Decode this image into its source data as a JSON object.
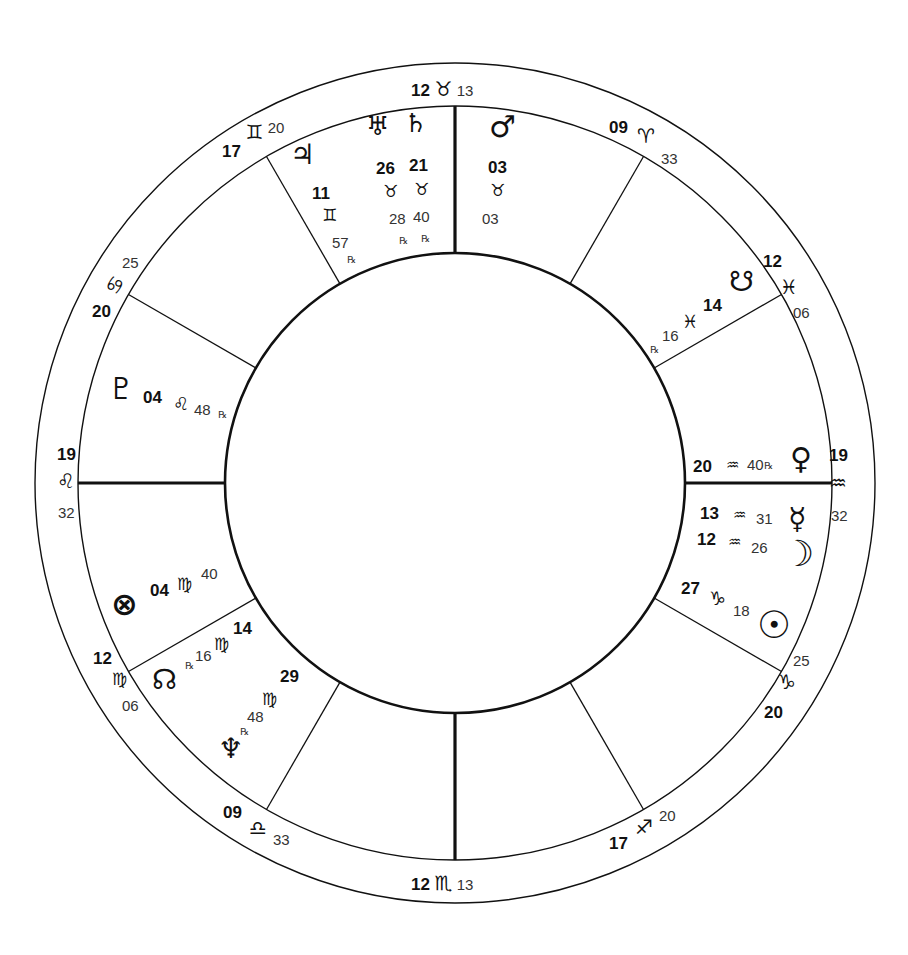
{
  "chart_geometry": {
    "center_x": 455,
    "center_y": 483,
    "outer_radius": 420,
    "zodiac_inner_radius": 377,
    "inner_radius": 230,
    "line_color": "#111111"
  },
  "house_cusps": [
    {
      "house": 1,
      "sign": "Leo",
      "glyph": "♌",
      "degree": "19",
      "minute": "32"
    },
    {
      "house": 2,
      "sign": "Virgo",
      "glyph": "♍",
      "degree": "12",
      "minute": "06"
    },
    {
      "house": 3,
      "sign": "Libra",
      "glyph": "♎",
      "degree": "09",
      "minute": "33"
    },
    {
      "house": 4,
      "sign": "Scorpio",
      "glyph": "♏",
      "degree": "12",
      "minute": "13"
    },
    {
      "house": 5,
      "sign": "Sagittarius",
      "glyph": "♐",
      "degree": "17",
      "minute": "20"
    },
    {
      "house": 6,
      "sign": "Capricorn",
      "glyph": "♑",
      "degree": "20",
      "minute": "25"
    },
    {
      "house": 7,
      "sign": "Aquarius",
      "glyph": "♒",
      "degree": "19",
      "minute": "32"
    },
    {
      "house": 8,
      "sign": "Pisces",
      "glyph": "♓",
      "degree": "12",
      "minute": "06"
    },
    {
      "house": 9,
      "sign": "Aries",
      "glyph": "♈",
      "degree": "09",
      "minute": "33"
    },
    {
      "house": 10,
      "sign": "Taurus",
      "glyph": "♉",
      "degree": "12",
      "minute": "13"
    },
    {
      "house": 11,
      "sign": "Gemini",
      "glyph": "♊",
      "degree": "17",
      "minute": "20"
    },
    {
      "house": 12,
      "sign": "Cancer",
      "glyph": "♋",
      "degree": "20",
      "minute": "25"
    }
  ],
  "planets": {
    "uranus": {
      "glyph": "♅",
      "degree": "26",
      "sign_glyph": "♉",
      "minute": "28",
      "retro": "℞"
    },
    "saturn": {
      "glyph": "♄",
      "degree": "21",
      "sign_glyph": "♉",
      "minute": "40",
      "retro": "℞"
    },
    "jupiter": {
      "glyph": "♃",
      "degree": "11",
      "sign_glyph": "♊",
      "minute": "57",
      "retro": "℞"
    },
    "mars": {
      "glyph": "♂",
      "degree": "03",
      "sign_glyph": "♉",
      "minute": "03"
    },
    "south_node": {
      "glyph": "☋",
      "degree": "14",
      "sign_glyph": "♓",
      "minute": "16",
      "retro": "℞"
    },
    "pluto": {
      "glyph": "♇",
      "degree": "04",
      "sign_glyph": "♌",
      "minute": "48",
      "retro": "℞"
    },
    "venus": {
      "glyph": "♀",
      "degree": "20",
      "sign_glyph": "♒",
      "minute": "40",
      "retro": "℞"
    },
    "mercury": {
      "glyph": "☿",
      "degree": "13",
      "sign_glyph": "♒",
      "minute": "31"
    },
    "moon": {
      "glyph": "☽",
      "degree": "12",
      "sign_glyph": "♒",
      "minute": "26"
    },
    "sun": {
      "glyph": "☉",
      "degree": "27",
      "sign_glyph": "♑",
      "minute": "18"
    },
    "part_of_fortune": {
      "glyph": "⊗",
      "degree": "04",
      "sign_glyph": "♍",
      "minute": "40"
    },
    "north_node": {
      "glyph": "☊",
      "degree": "14",
      "sign_glyph": "♍",
      "minute": "16",
      "retro": "℞"
    },
    "neptune": {
      "glyph": "♆",
      "degree": "29",
      "sign_glyph": "♍",
      "minute": "48",
      "retro": "℞"
    }
  }
}
